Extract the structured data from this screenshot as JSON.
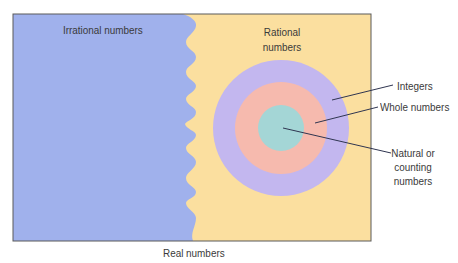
{
  "diagram": {
    "title": "Real numbers",
    "regions": {
      "irrational": {
        "label": "Irrational numbers",
        "color": "#a0b1ec"
      },
      "rational": {
        "label_line1": "Rational",
        "label_line2": "numbers",
        "color": "#fbdf9f"
      }
    },
    "nested_sets": [
      {
        "label": "Integers",
        "color": "#c3b7ef"
      },
      {
        "label": "Whole numbers",
        "color": "#f6baae"
      },
      {
        "label_line1": "Natural or",
        "label_line2": "counting",
        "label_line3": "numbers",
        "color": "#a4d6d6"
      }
    ],
    "border_color": "#5a5a5a",
    "leader_line_color": "#2f3550"
  }
}
